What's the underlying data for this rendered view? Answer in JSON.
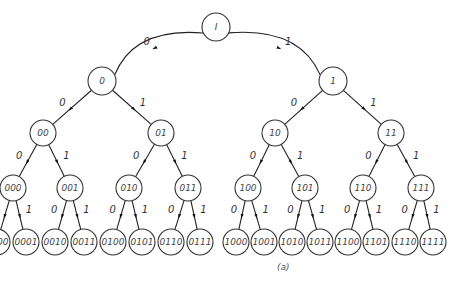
{
  "caption": "(a)",
  "root": {
    "label": "I",
    "x": 216,
    "y": 27,
    "r": 14
  },
  "levels": [
    {
      "y": 81,
      "r": 14,
      "nodes": [
        {
          "label": "0",
          "x": 102
        },
        {
          "label": "1",
          "x": 333
        }
      ]
    },
    {
      "y": 133,
      "r": 13,
      "nodes": [
        {
          "label": "00",
          "x": 43
        },
        {
          "label": "01",
          "x": 161
        },
        {
          "label": "10",
          "x": 275
        },
        {
          "label": "11",
          "x": 391
        }
      ]
    },
    {
      "y": 188,
      "r": 13,
      "nodes": [
        {
          "label": "000",
          "x": 13
        },
        {
          "label": "001",
          "x": 70
        },
        {
          "label": "010",
          "x": 129
        },
        {
          "label": "011",
          "x": 188
        },
        {
          "label": "100",
          "x": 248
        },
        {
          "label": "101",
          "x": 305
        },
        {
          "label": "110",
          "x": 363
        },
        {
          "label": "111",
          "x": 421
        }
      ]
    },
    {
      "y": 242,
      "r": 13,
      "nodes": [
        {
          "label": "0000",
          "x": -3
        },
        {
          "label": "0001",
          "x": 26
        },
        {
          "label": "0010",
          "x": 55
        },
        {
          "label": "0011",
          "x": 84
        },
        {
          "label": "0100",
          "x": 113
        },
        {
          "label": "0101",
          "x": 142
        },
        {
          "label": "0110",
          "x": 171
        },
        {
          "label": "0111",
          "x": 200
        },
        {
          "label": "1000",
          "x": 236
        },
        {
          "label": "1001",
          "x": 264
        },
        {
          "label": "1010",
          "x": 292
        },
        {
          "label": "1011",
          "x": 320
        },
        {
          "label": "1100",
          "x": 348
        },
        {
          "label": "1101",
          "x": 376
        },
        {
          "label": "1110",
          "x": 405
        },
        {
          "label": "1111",
          "x": 433
        }
      ]
    }
  ],
  "edge_labels": {
    "left": "0",
    "right": "1"
  }
}
